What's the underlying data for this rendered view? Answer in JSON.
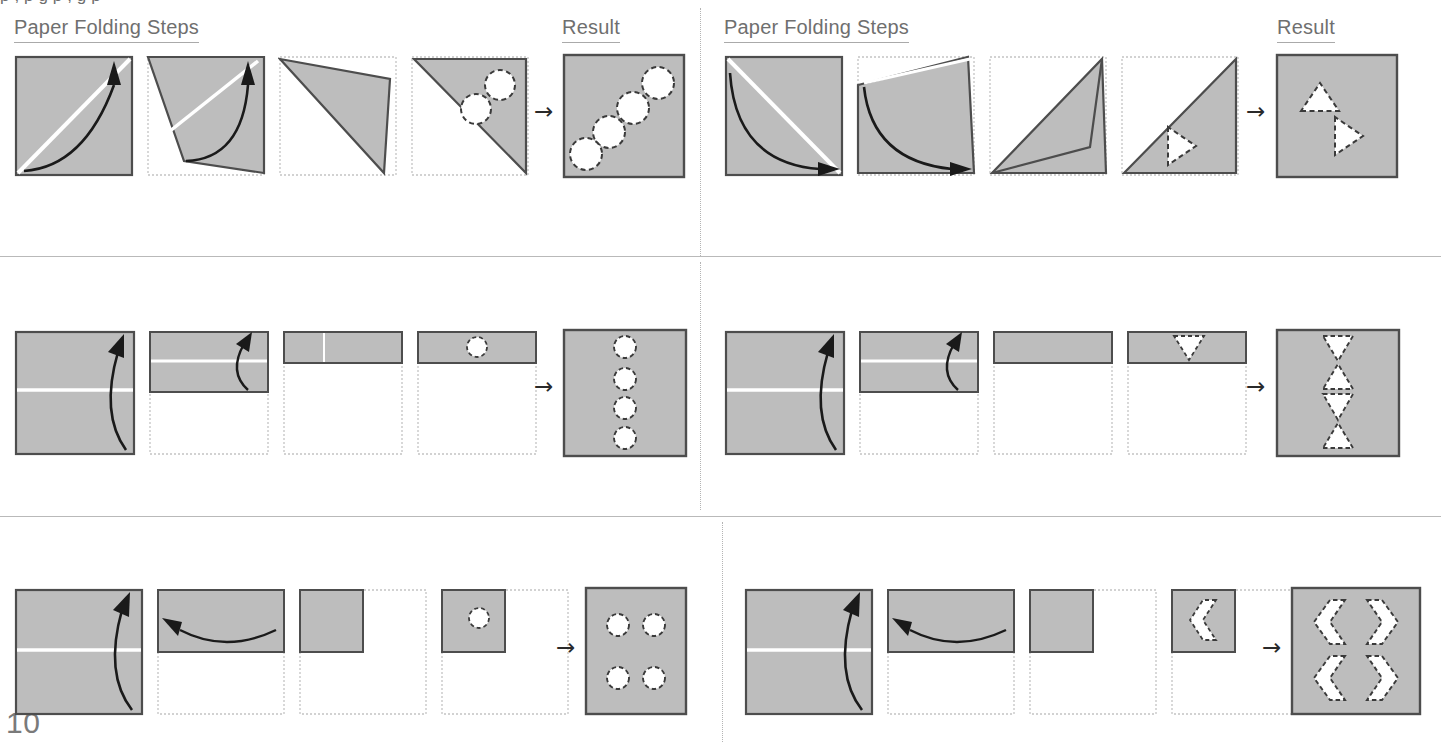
{
  "page": {
    "number": "10",
    "top_cut_text": "p                  ,                                p           g       p              ,                            g        p"
  },
  "colors": {
    "paper_fill": "#bdbdbd",
    "paper_stroke": "#4d4d4d",
    "ghost_stroke": "#c0c0c0",
    "fold_crease": "#ffffff",
    "hole_stroke": "#3a3a3a",
    "hole_fill": "#ffffff",
    "arrow": "#1a1a1a",
    "header_text": "#6f6f6f",
    "divider": "#b9b9b9"
  },
  "headers": {
    "steps_label": "Paper Folding Steps",
    "result_label": "Result",
    "arrow_glyph": "→"
  },
  "columns": [
    {
      "id": "left",
      "steps_label": "Paper Folding Steps",
      "result_label": "Result"
    },
    {
      "id": "right",
      "steps_label": "Paper Folding Steps",
      "result_label": "Result"
    }
  ],
  "puzzles": [
    {
      "id": "p1",
      "row": 1,
      "column": "left",
      "fold_count": 1,
      "fold_axis": "anti-diagonal",
      "punch_shape": "circle",
      "punch_count_folded": 2,
      "hole_count_result": 4,
      "result_pattern": "four circles along the anti-diagonal from bottom-left to top-right",
      "steps": [
        {
          "index": 1,
          "caption": "square, crease on anti-diagonal, arrow curving up-right"
        },
        {
          "index": 2,
          "caption": "bottom-left corner folded up over anti-diagonal"
        },
        {
          "index": 3,
          "caption": "folded triangle shown"
        },
        {
          "index": 4,
          "caption": "upper-right triangle with two punched circles"
        }
      ]
    },
    {
      "id": "p2",
      "row": 1,
      "column": "right",
      "fold_count": 1,
      "fold_axis": "main-diagonal",
      "punch_shape": "triangle-right",
      "punch_count_folded": 1,
      "hole_count_result": 2,
      "result_pattern": "two triangles: one pointing up at upper-left, one pointing right at center",
      "steps": [
        {
          "index": 1,
          "caption": "square, crease on main diagonal, arrow curving down-right"
        },
        {
          "index": 2,
          "caption": "top-left corner folded down over main diagonal"
        },
        {
          "index": 3,
          "caption": "folded triangle shown"
        },
        {
          "index": 4,
          "caption": "lower-right triangle with one right-pointing triangular punch"
        }
      ]
    },
    {
      "id": "p3",
      "row": 2,
      "column": "left",
      "fold_count": 2,
      "fold_axis": "horizontal",
      "punch_shape": "circle",
      "punch_count_folded": 1,
      "hole_count_result": 4,
      "result_pattern": "four circles in a single vertical column, evenly spaced",
      "steps": [
        {
          "index": 1,
          "caption": "square with horizontal mid crease, arrow folding bottom up"
        },
        {
          "index": 2,
          "caption": "half sheet with horizontal crease, arrow folding bottom up"
        },
        {
          "index": 3,
          "caption": "quarter strip shown at top"
        },
        {
          "index": 4,
          "caption": "quarter strip with one punched circle"
        }
      ]
    },
    {
      "id": "p4",
      "row": 2,
      "column": "right",
      "fold_count": 2,
      "fold_axis": "horizontal",
      "punch_shape": "triangle-down",
      "punch_count_folded": 1,
      "hole_count_result": 4,
      "result_pattern": "four triangles stacked vertically alternating down, up, down, up",
      "steps": [
        {
          "index": 1,
          "caption": "square with horizontal mid crease, arrow folding bottom up"
        },
        {
          "index": 2,
          "caption": "half sheet with horizontal crease, arrow folding bottom up"
        },
        {
          "index": 3,
          "caption": "quarter strip shown at top"
        },
        {
          "index": 4,
          "caption": "quarter strip with one downward triangular punch"
        }
      ]
    },
    {
      "id": "p5",
      "row": 3,
      "column": "left",
      "fold_count": 2,
      "fold_axis": "horizontal-then-vertical",
      "punch_shape": "circle",
      "punch_count_folded": 1,
      "hole_count_result": 4,
      "result_pattern": "four circles in a two-by-two grid",
      "steps": [
        {
          "index": 1,
          "caption": "square with horizontal mid crease, arrow folding bottom up"
        },
        {
          "index": 2,
          "caption": "half sheet, arrow folding right half to the left"
        },
        {
          "index": 3,
          "caption": "quarter square shown at top-left"
        },
        {
          "index": 4,
          "caption": "quarter square with one punched circle"
        }
      ]
    },
    {
      "id": "p6",
      "row": 3,
      "column": "right",
      "fold_count": 2,
      "fold_axis": "horizontal-then-vertical",
      "punch_shape": "chevron-left",
      "punch_count_folded": 1,
      "hole_count_result": 4,
      "result_pattern": "four chevrons in a two-by-two grid, mirrored left-right and top-bottom",
      "steps": [
        {
          "index": 1,
          "caption": "square with horizontal mid crease, arrow folding bottom up"
        },
        {
          "index": 2,
          "caption": "half sheet, arrow folding right half to the left"
        },
        {
          "index": 3,
          "caption": "quarter square shown at top-left"
        },
        {
          "index": 4,
          "caption": "quarter square with one left-pointing chevron punch"
        }
      ]
    }
  ]
}
